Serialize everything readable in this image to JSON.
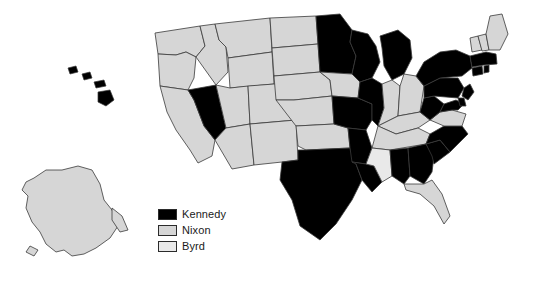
{
  "map": {
    "title": "",
    "colors": {
      "kennedy": "#000000",
      "nixon": "#d6d6d6",
      "byrd": "#e9e9e9",
      "border": "#3a3a3a",
      "background": "#ffffff"
    },
    "legend": [
      {
        "label": "Kennedy",
        "color": "#000000",
        "swatch_name": "legend-swatch-kennedy"
      },
      {
        "label": "Nixon",
        "color": "#d6d6d6",
        "swatch_name": "legend-swatch-nixon"
      },
      {
        "label": "Byrd",
        "color": "#e9e9e9",
        "swatch_name": "legend-swatch-byrd"
      }
    ],
    "states": [
      {
        "id": "WA",
        "winner": "Nixon"
      },
      {
        "id": "OR",
        "winner": "Nixon"
      },
      {
        "id": "CA",
        "winner": "Nixon"
      },
      {
        "id": "NV",
        "winner": "Kennedy"
      },
      {
        "id": "ID",
        "winner": "Nixon"
      },
      {
        "id": "MT",
        "winner": "Nixon"
      },
      {
        "id": "WY",
        "winner": "Nixon"
      },
      {
        "id": "UT",
        "winner": "Nixon"
      },
      {
        "id": "AZ",
        "winner": "Nixon"
      },
      {
        "id": "CO",
        "winner": "Nixon"
      },
      {
        "id": "NM",
        "winner": "Kennedy"
      },
      {
        "id": "ND",
        "winner": "Nixon"
      },
      {
        "id": "SD",
        "winner": "Nixon"
      },
      {
        "id": "NE",
        "winner": "Nixon"
      },
      {
        "id": "KS",
        "winner": "Nixon"
      },
      {
        "id": "OK",
        "winner": "Nixon"
      },
      {
        "id": "TX",
        "winner": "Kennedy"
      },
      {
        "id": "MN",
        "winner": "Kennedy"
      },
      {
        "id": "IA",
        "winner": "Nixon"
      },
      {
        "id": "MO",
        "winner": "Kennedy"
      },
      {
        "id": "AR",
        "winner": "Kennedy"
      },
      {
        "id": "LA",
        "winner": "Kennedy"
      },
      {
        "id": "WI",
        "winner": "Kennedy"
      },
      {
        "id": "IL",
        "winner": "Kennedy"
      },
      {
        "id": "MI",
        "winner": "Kennedy"
      },
      {
        "id": "IN",
        "winner": "Nixon"
      },
      {
        "id": "OH",
        "winner": "Nixon"
      },
      {
        "id": "KY",
        "winner": "Nixon"
      },
      {
        "id": "TN",
        "winner": "Nixon"
      },
      {
        "id": "MS",
        "winner": "Byrd"
      },
      {
        "id": "AL",
        "winner": "Kennedy"
      },
      {
        "id": "GA",
        "winner": "Kennedy"
      },
      {
        "id": "FL",
        "winner": "Nixon"
      },
      {
        "id": "SC",
        "winner": "Kennedy"
      },
      {
        "id": "NC",
        "winner": "Kennedy"
      },
      {
        "id": "VA",
        "winner": "Nixon"
      },
      {
        "id": "WV",
        "winner": "Kennedy"
      },
      {
        "id": "MD",
        "winner": "Kennedy"
      },
      {
        "id": "DE",
        "winner": "Kennedy"
      },
      {
        "id": "PA",
        "winner": "Kennedy"
      },
      {
        "id": "NY",
        "winner": "Kennedy"
      },
      {
        "id": "NJ",
        "winner": "Kennedy"
      },
      {
        "id": "CT",
        "winner": "Kennedy"
      },
      {
        "id": "RI",
        "winner": "Kennedy"
      },
      {
        "id": "MA",
        "winner": "Kennedy"
      },
      {
        "id": "VT",
        "winner": "Nixon"
      },
      {
        "id": "NH",
        "winner": "Nixon"
      },
      {
        "id": "ME",
        "winner": "Nixon"
      },
      {
        "id": "AK",
        "winner": "Nixon"
      },
      {
        "id": "HI",
        "winner": "Kennedy"
      }
    ]
  }
}
